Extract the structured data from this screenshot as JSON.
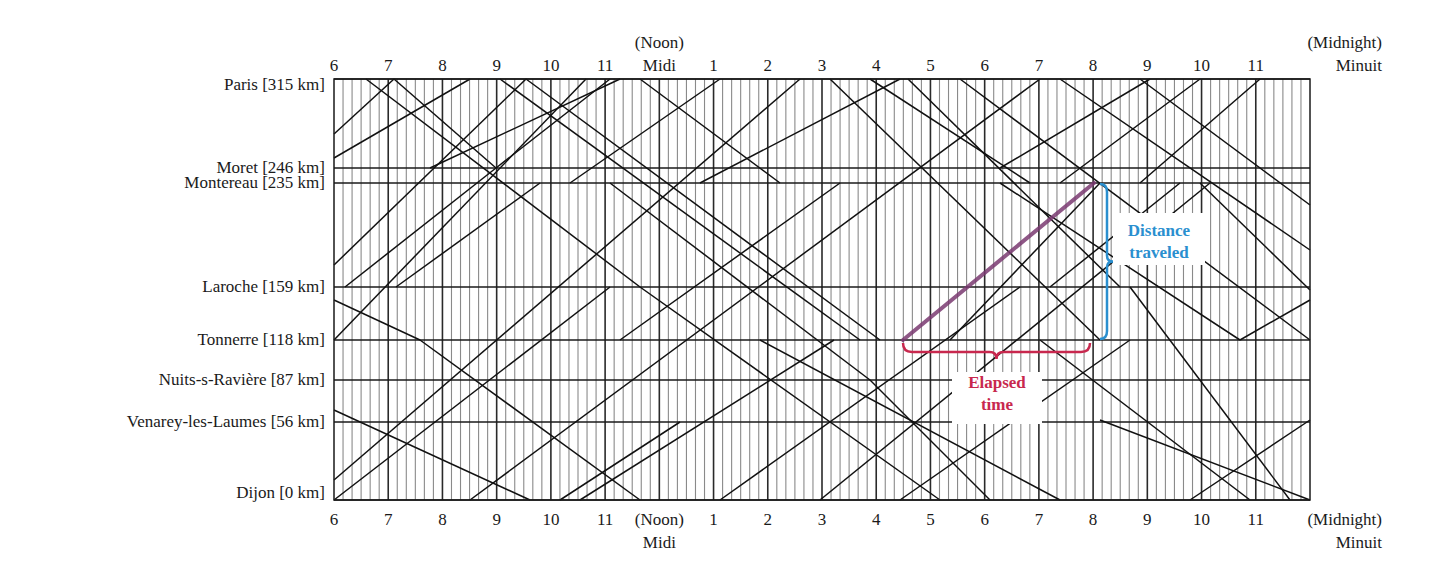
{
  "diagram": {
    "grid": {
      "x_start": 334,
      "x_end": 1310,
      "y_top": 79,
      "y_bottom": 500,
      "start_hour": 6,
      "end_hour": 24,
      "minor_tick_minutes": 10
    },
    "stations": [
      {
        "name": "Paris [315 km]",
        "km": 315,
        "y": 79
      },
      {
        "name": "Moret [246 km]",
        "km": 246,
        "y": 168
      },
      {
        "name": "Montereau [235 km]",
        "km": 235,
        "y": 183
      },
      {
        "name": "Laroche [159 km]",
        "km": 159,
        "y": 287
      },
      {
        "name": "Tonnerre [118 km]",
        "km": 118,
        "y": 340
      },
      {
        "name": "Nuits-s-Ravière [87 km]",
        "km": 87,
        "y": 380
      },
      {
        "name": "Venarey-les-Laumes [56 km]",
        "km": 56,
        "y": 422
      },
      {
        "name": "Dijon [0 km]",
        "km": 0,
        "y": 500
      }
    ],
    "hour_labels": [
      {
        "hour": 6,
        "label": "6"
      },
      {
        "hour": 7,
        "label": "7"
      },
      {
        "hour": 8,
        "label": "8"
      },
      {
        "hour": 9,
        "label": "9"
      },
      {
        "hour": 10,
        "label": "10"
      },
      {
        "hour": 11,
        "label": "11"
      },
      {
        "hour": 12,
        "label": "Midi",
        "top_sub": "(Noon)",
        "bottom_main": "(Noon)",
        "bottom_sub": "Midi"
      },
      {
        "hour": 13,
        "label": "1"
      },
      {
        "hour": 14,
        "label": "2"
      },
      {
        "hour": 15,
        "label": "3"
      },
      {
        "hour": 16,
        "label": "4"
      },
      {
        "hour": 17,
        "label": "5"
      },
      {
        "hour": 18,
        "label": "6"
      },
      {
        "hour": 19,
        "label": "7"
      },
      {
        "hour": 20,
        "label": "8"
      },
      {
        "hour": 21,
        "label": "9"
      },
      {
        "hour": 22,
        "label": "10"
      },
      {
        "hour": 23,
        "label": "11"
      },
      {
        "hour": 24,
        "label": "Minuit",
        "top_sub": "(Midnight)",
        "bottom_main": "(Midnight)",
        "bottom_sub": "Minuit"
      }
    ],
    "noon_top": {
      "line1": "(Noon)",
      "line2": "Midi"
    },
    "midnight_top": {
      "line1": "(Midnight)",
      "line2": "Minuit"
    },
    "noon_bottom": {
      "line1": "(Noon)",
      "line2": "Midi"
    },
    "midnight_bottom": {
      "line1": "(Midnight)",
      "line2": "Minuit"
    },
    "train_lines": [
      [
        334,
        134,
        394,
        79
      ],
      [
        334,
        158,
        470,
        79
      ],
      [
        366,
        79,
        640,
        287
      ],
      [
        394,
        79,
        496,
        168
      ],
      [
        334,
        265,
        526,
        79
      ],
      [
        334,
        340,
        586,
        79
      ],
      [
        345,
        287,
        496,
        168
      ],
      [
        396,
        287,
        540,
        183
      ],
      [
        496,
        168,
        610,
        79
      ],
      [
        500,
        79,
        860,
        340
      ],
      [
        430,
        168,
        620,
        79
      ],
      [
        640,
        79,
        780,
        183
      ],
      [
        560,
        500,
        680,
        422
      ],
      [
        334,
        410,
        530,
        500
      ],
      [
        334,
        480,
        800,
        79
      ],
      [
        470,
        500,
        1040,
        79
      ],
      [
        526,
        79,
        880,
        340
      ],
      [
        570,
        183,
        720,
        79
      ],
      [
        620,
        340,
        840,
        183
      ],
      [
        700,
        183,
        900,
        79
      ],
      [
        830,
        79,
        1100,
        340
      ],
      [
        870,
        79,
        1030,
        183
      ],
      [
        908,
        79,
        1120,
        287
      ],
      [
        960,
        79,
        1310,
        340
      ],
      [
        1060,
        79,
        1310,
        250
      ],
      [
        1140,
        79,
        1310,
        205
      ],
      [
        1150,
        79,
        1000,
        168
      ],
      [
        1200,
        79,
        1060,
        183
      ],
      [
        1260,
        79,
        1140,
        183
      ],
      [
        334,
        300,
        420,
        340
      ],
      [
        420,
        340,
        640,
        500
      ],
      [
        580,
        500,
        834,
        340
      ],
      [
        640,
        287,
        940,
        500
      ],
      [
        720,
        500,
        1020,
        287
      ],
      [
        760,
        340,
        1060,
        500
      ],
      [
        820,
        500,
        1210,
        183
      ],
      [
        900,
        500,
        1130,
        340
      ],
      [
        950,
        340,
        1100,
        183
      ],
      [
        1040,
        340,
        1250,
        500
      ],
      [
        1100,
        420,
        1310,
        500
      ],
      [
        1130,
        287,
        1290,
        500
      ],
      [
        1200,
        183,
        1310,
        290
      ],
      [
        1240,
        340,
        1310,
        300
      ],
      [
        1190,
        500,
        1310,
        420
      ],
      [
        610,
        183,
        870,
        380
      ],
      [
        870,
        380,
        990,
        500
      ],
      [
        334,
        500,
        610,
        287
      ],
      [
        1000,
        183,
        1240,
        340
      ],
      [
        1050,
        287,
        1180,
        183
      ]
    ],
    "highlight": {
      "train_color": "#7b3a72",
      "from": {
        "x": 903,
        "y": 340
      },
      "to": {
        "x": 1094,
        "y": 183
      }
    },
    "annotations": {
      "distance": {
        "label_line1": "Distance",
        "label_line2": "traveled",
        "color": "#2a8fcf"
      },
      "elapsed": {
        "label_line1": "Elapsed",
        "label_line2": "time",
        "color": "#c8284e"
      }
    }
  }
}
